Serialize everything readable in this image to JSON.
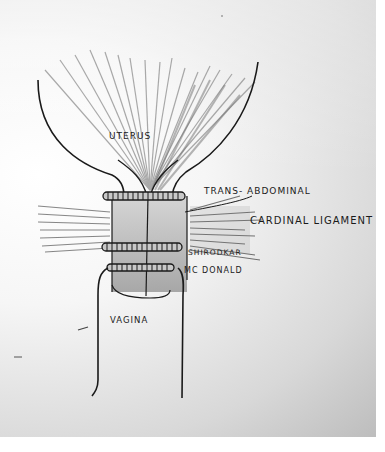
{
  "diagram": {
    "type": "hand-drawn anatomical sketch",
    "labels": {
      "uterus": "UTERUS",
      "trans_abdominal": "TRANS- ABDOMINAL",
      "cardinal_ligament": "CARDINAL LIGAMENT",
      "shirodkar": "SHIRODKAR",
      "mcdonald": "MC DONALD",
      "vagina": "VAGINA"
    },
    "colors": {
      "ink": "#1a1a1a",
      "pencil_shading": "#8a8a8a",
      "paper": "#f4f4f4"
    }
  }
}
